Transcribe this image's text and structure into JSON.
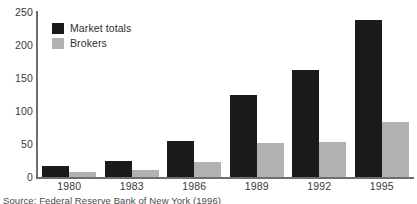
{
  "chart_data": {
    "type": "bar",
    "title": "",
    "xlabel": "",
    "ylabel": "",
    "categories": [
      "1980",
      "1983",
      "1986",
      "1989",
      "1992",
      "1995"
    ],
    "series": [
      {
        "name": "Market totals",
        "color": "#1b1b1b",
        "values": [
          16,
          24,
          55,
          125,
          162,
          238
        ]
      },
      {
        "name": "Brokers",
        "color": "#b2b2b2",
        "values": [
          7,
          11,
          23,
          51,
          53,
          83
        ]
      }
    ],
    "ylim": [
      0,
      250
    ],
    "yticks": [
      0,
      50,
      100,
      150,
      200,
      250
    ],
    "grid": false,
    "legend_position": "top-left"
  },
  "axis": {
    "y_labels": [
      "250",
      "200",
      "150",
      "100",
      "50",
      "0"
    ],
    "x_labels": [
      "1980",
      "1983",
      "1986",
      "1989",
      "1992",
      "1995"
    ]
  },
  "legend": {
    "items": [
      {
        "label": "Market totals",
        "color": "#1b1b1b"
      },
      {
        "label": "Brokers",
        "color": "#b2b2b2"
      }
    ]
  },
  "source": {
    "text": "Source: Federal Reserve Bank of New York (1996)"
  }
}
